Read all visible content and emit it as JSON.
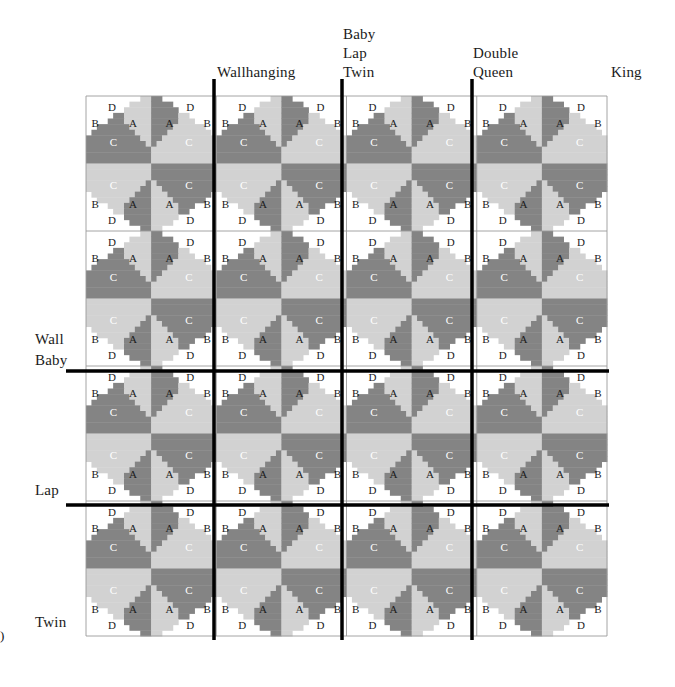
{
  "figure": {
    "type": "quilt-layout-diagram"
  },
  "colors": {
    "background": "#ffffff",
    "fabric_a_light": "#d2d2d2",
    "fabric_c_dark": "#848484",
    "fabric_bd_white": "#ffffff",
    "grid_line": "#9a9a9a",
    "divider_line": "#000000",
    "text": "#1b1b1b"
  },
  "column_headers": [
    {
      "label": "Wallhanging",
      "lines": [
        "Wallhanging"
      ],
      "x": 217,
      "y": 63
    },
    {
      "label": "Baby Lap Twin",
      "lines": [
        "Baby",
        "Lap",
        "Twin"
      ],
      "x": 343,
      "y": 25
    },
    {
      "label": "Double Queen",
      "lines": [
        "Double",
        "Queen"
      ],
      "x": 473,
      "y": 44
    },
    {
      "label": "King",
      "lines": [
        "King"
      ],
      "x": 611,
      "y": 63
    }
  ],
  "row_headers": [
    {
      "label": "Wall Baby",
      "lines": [
        "Wall",
        "Baby"
      ],
      "x": 35,
      "y": 329
    },
    {
      "label": "Lap",
      "lines": [
        "Lap"
      ],
      "x": 35,
      "y": 480
    },
    {
      "label": "Twin",
      "lines": [
        "Twin"
      ],
      "x": 35,
      "y": 612
    }
  ],
  "grid": {
    "left": 86,
    "top": 96,
    "right": 607,
    "bottom": 636,
    "block_cols": 4,
    "block_rows": 4,
    "block_width": 130.25,
    "block_height": 135,
    "cell_divisions": 12
  },
  "dividers": {
    "vertical_x": [
      214,
      342,
      472
    ],
    "horizontal_y": [
      371,
      505
    ],
    "thickness": 3.5
  },
  "patch_labels": {
    "a": "A",
    "b": "B",
    "c": "C",
    "d": "D"
  },
  "quadrant_label_positions": [
    {
      "label": "D",
      "cx": 0.4,
      "cy": 0.16
    },
    {
      "label": "B",
      "cx": 0.14,
      "cy": 0.4
    },
    {
      "label": "A",
      "cx": 0.72,
      "cy": 0.4
    },
    {
      "label": "C",
      "cx": 0.42,
      "cy": 0.68
    }
  ],
  "corner_mark": ")",
  "legend_note": "Each block is a four-quadrant pinwheel of patches A, B, C and D."
}
